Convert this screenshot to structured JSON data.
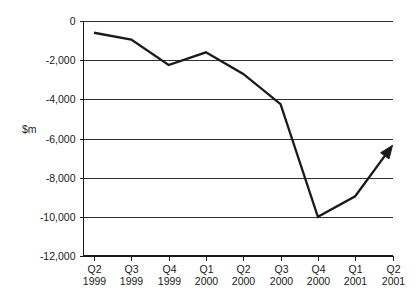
{
  "chart_data": {
    "type": "line",
    "title": "",
    "subtitle": "",
    "xlabel": "",
    "ylabel": "$m",
    "categories": [
      "Q2 1999",
      "Q3 1999",
      "Q4 1999",
      "Q1 2000",
      "Q2 2000",
      "Q3 2000",
      "Q4 2000",
      "Q1 2001",
      "Q2 2001"
    ],
    "category_lines": [
      [
        "Q2",
        "1999"
      ],
      [
        "Q3",
        "1999"
      ],
      [
        "Q4",
        "1999"
      ],
      [
        "Q1",
        "2000"
      ],
      [
        "Q2",
        "2000"
      ],
      [
        "Q3",
        "2000"
      ],
      [
        "Q4",
        "2000"
      ],
      [
        "Q1",
        "2001"
      ],
      [
        "Q2",
        "2001"
      ]
    ],
    "values": [
      -600,
      -950,
      -2250,
      -1600,
      -2700,
      -4250,
      -10000,
      -8950,
      -6350
    ],
    "series": [
      {
        "name": "",
        "values": [
          -600,
          -950,
          -2250,
          -1600,
          -2700,
          -4250,
          -10000,
          -8950,
          -6350
        ],
        "color": "#1a1a1a",
        "arrow_at_end": true
      }
    ],
    "ylim": [
      -12000,
      0
    ],
    "ytick_values": [
      0,
      -2000,
      -4000,
      -6000,
      -8000,
      -10000,
      -12000
    ],
    "ytick_labels": [
      "0",
      "-2,000",
      "-4,000",
      "-6,000",
      "-8,000",
      "-10,000",
      "-12,000"
    ],
    "grid": true,
    "grid_axis": "y",
    "legend": false,
    "legend_position": "none"
  },
  "colors": {
    "line": "#1a1a1a",
    "grid": "#1a1a1a",
    "axis": "#1a1a1a",
    "background": "#ffffff",
    "text": "#1a1a1a"
  }
}
